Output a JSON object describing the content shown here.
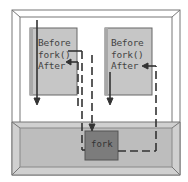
{
  "diagram": {
    "parent_process": {
      "lines": [
        "Before",
        "fork()",
        "After"
      ]
    },
    "child_process": {
      "lines": [
        "Before",
        "fork()",
        "After"
      ]
    },
    "kernel": {
      "fork_label": "fork"
    },
    "colors": {
      "frame": "#888888",
      "process_box": "#c4c4c4",
      "kernel_slab": "#bdbdbd",
      "fork_box": "#7a7a7a",
      "arrow": "#333333"
    }
  }
}
